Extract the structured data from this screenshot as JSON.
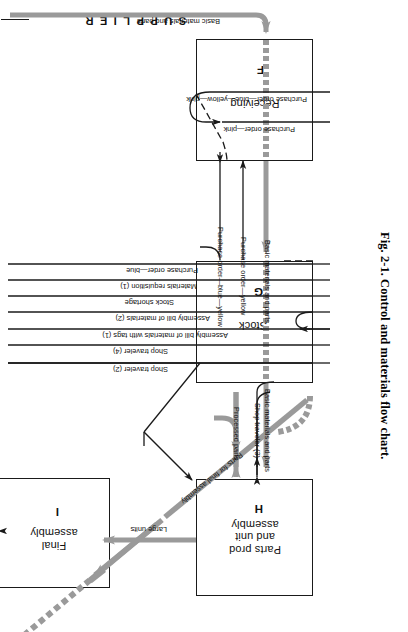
{
  "figure": {
    "caption": "Fig. 2-1.   Control and materials flow chart.",
    "header_label": "SUPPLIER"
  },
  "boxes": [
    {
      "id": "F",
      "name": "Receiving",
      "label": "Receiving"
    },
    {
      "id": "G",
      "name": "Stock",
      "label": "Stock"
    },
    {
      "id": "H",
      "name": "PartsProd",
      "label": "Parts prod\nand unit\nassembly"
    },
    {
      "id": "I",
      "name": "FinalAsm",
      "label": "Final\nassembly"
    }
  ],
  "flow_labels": {
    "basic_materials_top": "Basic materials and parts",
    "purchase_order_byp": "Purchase order—blue—yellow—pink",
    "purchase_order_pink": "Purchase order—pink",
    "purchase_order_yellow": "Purchase order—yellow",
    "purchase_order_blue_yellow": "Purchase order—blue—yellow",
    "basic_materials_mid": "Basic materials and parts",
    "purchase_order_blue": "Purchase order—blue",
    "materials_requisition": "Materials requisition (1)",
    "stock_shortage": "Stock shortage",
    "assembly_bom_2": "Assembly bill of materials (2)",
    "assembly_bom_tags_1": "Assembly bill of materials with tags (1)",
    "shop_traveler_4": "Shop traveler (4)",
    "shop_traveler_2": "Shop traveler (2)",
    "shop_traveler_3": "Shop traveler (3)",
    "processed_parts": "Processed parts",
    "basic_materials_bottom": "Basic materials and parts",
    "parts_for_final_assembly": "Parts for final assembly",
    "large_units": "Large units",
    "machine": "Machine"
  },
  "colors": {
    "ink": "#1a1a1a",
    "material_gray": "#9a9a9a",
    "material_gray_dark": "#7d7d7d",
    "paper": "#ffffff"
  }
}
